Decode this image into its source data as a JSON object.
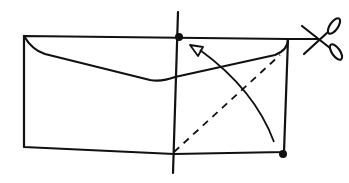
{
  "diagram": {
    "stroke_color": "#111111",
    "background": "#ffffff",
    "elements": [
      {
        "name": "envelope-outline",
        "type": "rectangle"
      },
      {
        "name": "envelope-flap",
        "type": "curve"
      },
      {
        "name": "vertical-fold-line",
        "type": "line"
      },
      {
        "name": "diagonal-dashed-fold",
        "type": "dashed-line"
      },
      {
        "name": "fold-arrow",
        "type": "curved-arrow"
      },
      {
        "name": "top-intersection-dot",
        "type": "dot"
      },
      {
        "name": "bottom-right-corner-dot",
        "type": "dot"
      },
      {
        "name": "cut-line",
        "type": "line"
      },
      {
        "name": "scissors-icon",
        "type": "icon"
      }
    ]
  }
}
